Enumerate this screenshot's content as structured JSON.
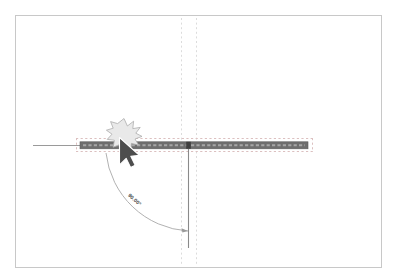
{
  "app": {
    "type": "cad-drawing-canvas",
    "title": "",
    "background_color": "#ffffff"
  },
  "sheet": {
    "name": "drawing-sheet",
    "border_color": "#c8c8c8",
    "x": 15,
    "y": 15,
    "width": 366,
    "height": 252
  },
  "colors": {
    "member_fill": "#6e6e6e",
    "member_hatch": "#8f8f8f",
    "member_outline": "#5a5a5a",
    "selection_dash": "#d9b6b6",
    "guide_dash": "#d8d8d8",
    "axis_line": "#8a8a8a",
    "extension_line": "#9a9a9a",
    "dimension_arc": "#a0a0a0",
    "cursor_fill": "#4d4d4d",
    "cursor_outline": "#ffffff",
    "burst_fill": "#e8e8e8",
    "burst_outline": "#a8a8a8",
    "label_text": "#4a4a4a"
  },
  "entities": {
    "horizontal_member": {
      "label": "horizontal-member",
      "x1": 80,
      "x2": 308,
      "y": 145,
      "thickness": 7
    },
    "horizontal_axis_extension": {
      "label": "horizontal-axis-extension",
      "x1": 33,
      "x2": 80,
      "y": 145
    },
    "vertical_member": {
      "label": "vertical-member",
      "x": 188,
      "y1": 145,
      "y2": 248
    },
    "node_marker": {
      "label": "node-marker",
      "x": 188,
      "y": 145
    }
  },
  "selection": {
    "label": "selection-bounding-box",
    "x": 76,
    "y": 138,
    "width": 237,
    "height": 14,
    "style": "dashed"
  },
  "guides": {
    "vertical_guide_left": {
      "x": 181,
      "y1": 18,
      "y2": 264
    },
    "vertical_guide_right": {
      "x": 196,
      "y1": 18,
      "y2": 264
    },
    "horizontal_guide_top": {
      "y": 138,
      "x1": 76,
      "x2": 313
    },
    "horizontal_guide_bottom": {
      "y": 152,
      "x1": 76,
      "x2": 313
    }
  },
  "dimension": {
    "name": "angular-dimension",
    "value_text": "90.00°",
    "value": 90.0,
    "unit": "degrees",
    "arc": {
      "start_x": 106,
      "start_y": 153,
      "end_x": 188,
      "end_y": 231,
      "radius": 86
    },
    "label_position": {
      "x": 133,
      "y": 196,
      "rotation": 45
    },
    "arrowhead": {
      "x": 188,
      "y": 231
    }
  },
  "pointer": {
    "name": "mouse-cursor",
    "x": 120,
    "y": 140,
    "state": "click"
  },
  "click_indicator": {
    "name": "click-burst",
    "x": 124,
    "y": 134,
    "radius": 15,
    "points": 11
  }
}
